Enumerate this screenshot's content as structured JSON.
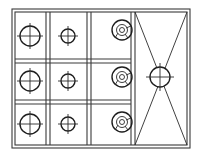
{
  "diagram": {
    "title": "",
    "type": "stove-top-layout",
    "colors": {
      "line": "#3a3a3a",
      "symbol": "#1e1e1e",
      "background": "#ffffff"
    },
    "frame": {
      "outer": [
        12,
        9,
        190,
        148
      ],
      "inner": [
        15,
        12,
        187,
        145
      ]
    },
    "columns": [
      {
        "name": "large-burner-column",
        "symbol": "circle-crosshair",
        "cx": 30,
        "r": 10,
        "rows_cy": [
          36,
          81,
          124
        ]
      },
      {
        "name": "small-burner-column",
        "symbol": "circle-crosshair",
        "cx": 68,
        "r": 7,
        "rows_cy": [
          36,
          81,
          124
        ]
      },
      {
        "name": "ring-burner-column",
        "symbol": "concentric-ring",
        "cx": 122,
        "r": 10,
        "rows_cy": [
          30,
          77,
          122
        ]
      }
    ],
    "right_panel": {
      "symbol": "x-with-center-circle",
      "center": [
        160,
        77
      ],
      "r": 10
    }
  }
}
